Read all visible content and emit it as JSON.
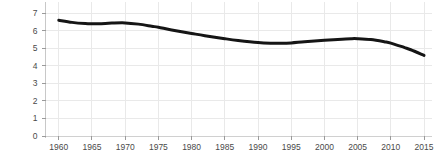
{
  "chart_data": {
    "type": "line",
    "title": "",
    "xlabel": "",
    "ylabel": "Workers Per Elderly Ratio",
    "xlim": [
      1958,
      2016
    ],
    "ylim": [
      0,
      7.3
    ],
    "grid": true,
    "legend": null,
    "line_color": "#151515",
    "line_width": 3,
    "grid_color": "#e9e9e9",
    "axis_color": "#d5d5d5",
    "background": "#ffffff",
    "xticks": [
      1960,
      1965,
      1970,
      1975,
      1980,
      1985,
      1990,
      1995,
      2000,
      2005,
      2010,
      2015
    ],
    "xtick_labels": [
      "1960",
      "1965",
      "1970",
      "1975",
      "1980",
      "1985",
      "1990",
      "1995",
      "2000",
      "2005",
      "2010",
      "2015"
    ],
    "yticks": [
      0,
      1,
      2,
      3,
      4,
      5,
      6,
      7
    ],
    "ytick_labels": [
      "0",
      "1",
      "2",
      "3",
      "4",
      "5",
      "6",
      "7"
    ],
    "series": [
      {
        "name": "Workers Per Elderly Ratio",
        "x": [
          1960,
          1962,
          1964,
          1965,
          1967,
          1968,
          1970,
          1972,
          1974,
          1975,
          1977,
          1980,
          1982,
          1985,
          1987,
          1990,
          1992,
          1993,
          1995,
          1997,
          2000,
          2002,
          2004,
          2005,
          2007,
          2009,
          2010,
          2012,
          2013,
          2015
        ],
        "values": [
          6.6,
          6.48,
          6.41,
          6.4,
          6.42,
          6.44,
          6.45,
          6.38,
          6.26,
          6.2,
          6.05,
          5.85,
          5.72,
          5.55,
          5.45,
          5.33,
          5.29,
          5.29,
          5.31,
          5.38,
          5.46,
          5.51,
          5.55,
          5.55,
          5.5,
          5.38,
          5.3,
          5.05,
          4.92,
          4.6
        ]
      }
    ]
  },
  "axes": {
    "y_axis_label": "Workers Per Elderly Ratio"
  }
}
